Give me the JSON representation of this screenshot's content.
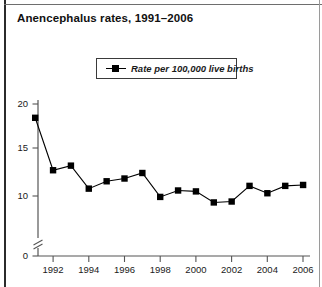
{
  "title": "Anencephalus rates, 1991–2006",
  "legend": {
    "label": "Rate per 100,000 live births",
    "marker": "square-line-marker"
  },
  "axis": {
    "y_ticks": [
      "0",
      "10",
      "15",
      "20"
    ],
    "x_ticks": [
      "1992",
      "1994",
      "1996",
      "1998",
      "2000",
      "2002",
      "2004",
      "2006"
    ],
    "y_break": "axis-break"
  },
  "colors": {
    "line": "#000000",
    "marker": "#000000",
    "axis": "#555555",
    "text": "#1a1a1a",
    "frame": "#2b2b2b",
    "background": "#ffffff"
  },
  "chart_data": {
    "type": "line",
    "title": "Anencephalus rates, 1991–2006",
    "xlabel": "",
    "ylabel": "",
    "ylim": [
      0,
      20
    ],
    "y_break_between": [
      0,
      10
    ],
    "grid": false,
    "legend_position": "top-center",
    "x": [
      1991,
      1992,
      1993,
      1994,
      1995,
      1996,
      1997,
      1998,
      1999,
      2000,
      2001,
      2002,
      2003,
      2004,
      2005,
      2006
    ],
    "series": [
      {
        "name": "Rate per 100,000 live births",
        "values": [
          18.5,
          12.8,
          13.3,
          10.8,
          11.6,
          11.9,
          12.5,
          9.9,
          10.6,
          10.5,
          9.3,
          9.4,
          11.1,
          10.3,
          11.1,
          11.2
        ]
      }
    ],
    "y_tick_values": [
      0,
      10,
      15,
      20
    ],
    "x_tick_values": [
      1992,
      1994,
      1996,
      1998,
      2000,
      2002,
      2004,
      2006
    ]
  },
  "geometry": {
    "x0_px": 35.2,
    "x_step_px": 17.86,
    "y_20_px": 104,
    "y_15_px": 148,
    "y_10_px": 196,
    "y_0_px": 256,
    "axis_left_px": 38,
    "axis_right_px": 310,
    "axis_top_px": 100,
    "break_y_px": 243
  }
}
